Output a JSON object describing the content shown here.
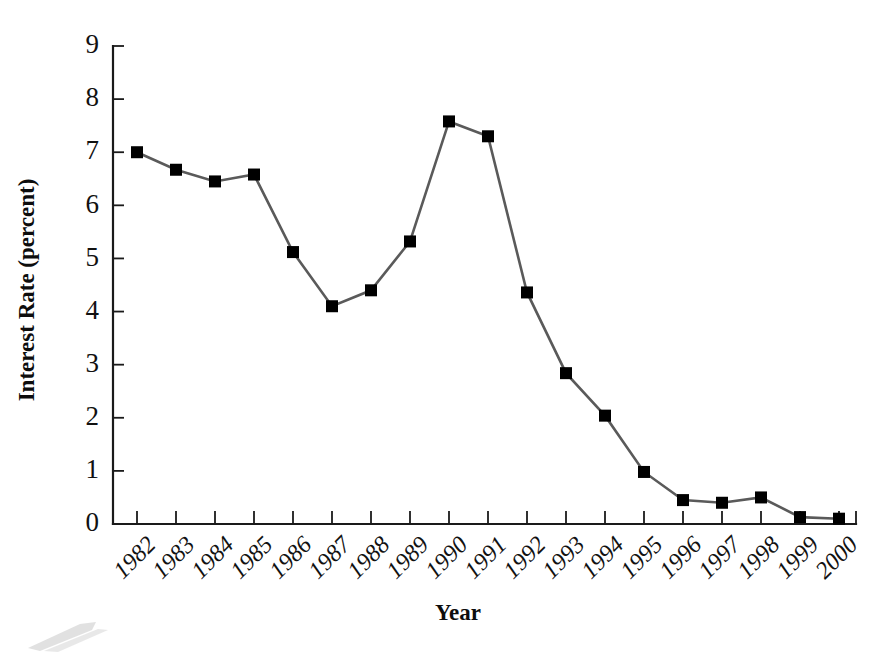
{
  "chart_data": {
    "type": "line",
    "title": "",
    "xlabel": "Year",
    "ylabel": "Interest Rate (percent)",
    "categories": [
      "1982",
      "1983",
      "1984",
      "1985",
      "1986",
      "1987",
      "1988",
      "1989",
      "1990",
      "1991",
      "1992",
      "1993",
      "1994",
      "1995",
      "1996",
      "1997",
      "1998",
      "1999",
      "2000"
    ],
    "values": [
      7.0,
      6.67,
      6.45,
      6.58,
      5.12,
      4.1,
      4.4,
      5.32,
      7.58,
      7.3,
      4.36,
      2.84,
      2.04,
      0.98,
      0.45,
      0.4,
      0.5,
      0.13,
      0.1
    ],
    "series": [
      {
        "name": "Interest Rate",
        "values": [
          7.0,
          6.67,
          6.45,
          6.58,
          5.12,
          4.1,
          4.4,
          5.32,
          7.58,
          7.3,
          4.36,
          2.84,
          2.04,
          0.98,
          0.45,
          0.4,
          0.5,
          0.13,
          0.1
        ]
      }
    ],
    "ylim": [
      0,
      9
    ],
    "yticks": [
      0,
      1,
      2,
      3,
      4,
      5,
      6,
      7,
      8,
      9
    ],
    "ytick_labels": [
      "0",
      "1",
      "2",
      "3",
      "4",
      "5",
      "6",
      "7",
      "8",
      "9"
    ],
    "xtick_labels": [
      "1982",
      "1983",
      "1984",
      "1985",
      "1986",
      "1987",
      "1988",
      "1989",
      "1990",
      "1991",
      "1992",
      "1993",
      "1994",
      "1995",
      "1996",
      "1997",
      "1998",
      "1999",
      "2000"
    ],
    "grid": false,
    "legend": false,
    "legend_position": "none",
    "marker": "square",
    "marker_color": "#000000",
    "line_color": "#5a5a5a",
    "axis_color": "#1a1a1a",
    "background": "#ffffff",
    "xtick_label_rotation": -45
  },
  "axes": {
    "x_title": "Year",
    "y_title": "Interest Rate (percent)"
  }
}
